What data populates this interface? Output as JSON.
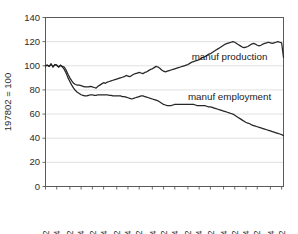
{
  "chart_data": {
    "type": "line",
    "title": "",
    "subtitle": "",
    "xlabel": "",
    "ylabel": "197802 = 100",
    "ylim": [
      0,
      140
    ],
    "yticks": [
      0,
      20,
      40,
      60,
      80,
      100,
      120,
      140
    ],
    "ytick_labels": [
      "0",
      "20",
      "40",
      "60",
      "80",
      "100",
      "120",
      "140"
    ],
    "grid": true,
    "grid_axis": "y",
    "legend_position": "inline-annotation",
    "xtick_labels": [
      "1978 2",
      "1979 4",
      "1981 2",
      "1982 4",
      "1984 2",
      "1985 4",
      "1987 2",
      "1988 4",
      "1990 2",
      "1991 4",
      "1993 2",
      "1994 4",
      "1996 2",
      "1997 4",
      "1999 2",
      "2000 4",
      "2002 2",
      "2003 4",
      "2005 2",
      "2006 4",
      "2008 2"
    ],
    "x_index_of_ticks": [
      0,
      6,
      13,
      19,
      25,
      31,
      38,
      44,
      50,
      57,
      63,
      69,
      76,
      82,
      88,
      95,
      101,
      107,
      113,
      120,
      126
    ],
    "n_points": 128,
    "annotations": [
      {
        "text": "manuf production",
        "x_index": 78,
        "y_value": 105
      },
      {
        "text": "manuf employment",
        "x_index": 76,
        "y_value": 72
      }
    ],
    "series": [
      {
        "name": "manuf production",
        "color": "#262626",
        "values": [
          100,
          100.5,
          99.5,
          101.5,
          99,
          101,
          100.5,
          99,
          100.5,
          99.5,
          99,
          96.5,
          93,
          90,
          87.5,
          85.5,
          84.5,
          84,
          84,
          83.5,
          83,
          82.5,
          82.5,
          82.5,
          83,
          82.5,
          82,
          81.5,
          83,
          84,
          85,
          86,
          85.5,
          86.5,
          87,
          87.5,
          88,
          88.5,
          89,
          89.5,
          90,
          90.5,
          91,
          92,
          91.5,
          91,
          92,
          93,
          93.5,
          94,
          94.5,
          94,
          93.5,
          94.5,
          95,
          96,
          97,
          97.5,
          98.5,
          99.5,
          99,
          98,
          96.5,
          95.5,
          95,
          95.5,
          96,
          96.5,
          97,
          97.5,
          98,
          98.5,
          99,
          99.5,
          100,
          100.5,
          101,
          102,
          103,
          103.5,
          104,
          104.5,
          105,
          106,
          107,
          107.5,
          108.5,
          109.5,
          110,
          111,
          112,
          113,
          114,
          115,
          116,
          117,
          118,
          118.5,
          119,
          119.5,
          120,
          119.5,
          118.5,
          117.5,
          116.5,
          115.5,
          115,
          115.5,
          116,
          117,
          118,
          118.5,
          118,
          117,
          116.5,
          117,
          118,
          118.5,
          119,
          119.5,
          119,
          118.5,
          119,
          119.5,
          120,
          119.5,
          119,
          107
        ]
      },
      {
        "name": "manuf employment",
        "color": "#262626",
        "values": [
          100,
          100.5,
          99.5,
          101.5,
          99,
          101,
          100.5,
          99,
          100.5,
          99,
          97,
          94,
          90,
          87,
          84,
          81.5,
          79.5,
          78,
          77,
          76,
          75.5,
          75,
          75,
          75.5,
          76,
          76,
          75.5,
          75.5,
          76,
          76,
          76,
          76,
          76,
          76,
          75.5,
          75.5,
          75,
          75,
          75,
          75,
          75,
          74.5,
          74.5,
          74,
          73.5,
          73,
          72.5,
          73,
          73.5,
          74,
          74.5,
          75,
          75,
          74.5,
          74,
          73.5,
          73,
          72.5,
          72,
          71.5,
          71,
          70,
          69,
          68,
          67.5,
          67,
          67,
          67,
          67.5,
          68,
          68,
          68,
          68,
          68,
          68,
          68,
          68,
          68,
          68,
          68,
          67.5,
          67,
          67,
          67,
          67,
          67,
          66.5,
          66,
          66,
          65.5,
          65,
          64.5,
          64,
          63.5,
          63,
          62.5,
          62,
          61.5,
          61,
          60.5,
          60,
          59,
          58,
          57,
          56,
          55,
          54,
          53,
          52.5,
          52,
          51,
          50.5,
          50,
          49.5,
          49,
          48.5,
          48,
          47.5,
          47,
          46.5,
          46,
          45.5,
          45,
          44.5,
          44,
          43.5,
          43,
          42
        ]
      }
    ]
  }
}
